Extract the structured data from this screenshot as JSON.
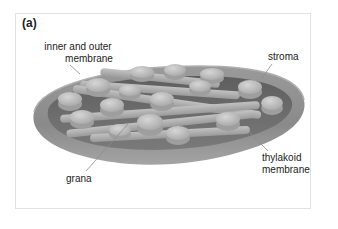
{
  "figure": {
    "panel_label": "(a)",
    "labels": {
      "inner_outer_membrane_line1": "inner and outer",
      "inner_outer_membrane_line2": "membrane",
      "stroma": "stroma",
      "thylakoid_line1": "thylakoid",
      "thylakoid_line2": "membrane",
      "grana": "grana"
    },
    "colors": {
      "outer_shell": "#8a8a8a",
      "shell_rim": "#a9a9a9",
      "inner_floor": "#6f6f6f",
      "granum_face": "#c4c4c4",
      "granum_side": "#9e9e9e",
      "tube": "#b3b3b3",
      "leader_line": "#8c8c8c",
      "panel_border": "#e2e2e2"
    }
  }
}
